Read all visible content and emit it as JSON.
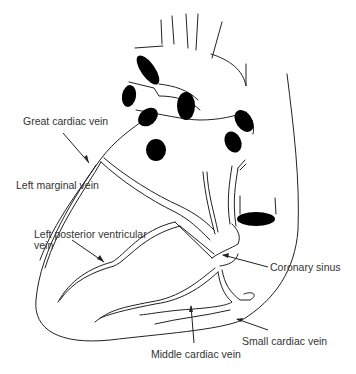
{
  "figure": {
    "background": "#ffffff",
    "line_color": "#222222",
    "labels": [
      {
        "id": "great-cardiac-vein",
        "text": "Great cardiac vein"
      },
      {
        "id": "left-marginal-vein",
        "text": "Left marginal vein"
      },
      {
        "id": "left-posterior-ventricular-vein",
        "line1": "Left posterior ventricular",
        "line2": "vein"
      },
      {
        "id": "coronary-sinus",
        "text": "Coronary sinus"
      },
      {
        "id": "small-cardiac-vein",
        "text": "Small cardiac vein"
      },
      {
        "id": "middle-cardiac-vein",
        "text": "Middle cardiac vein"
      }
    ]
  }
}
